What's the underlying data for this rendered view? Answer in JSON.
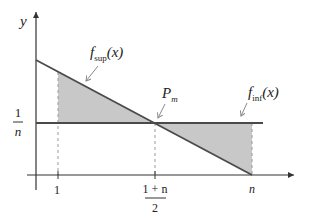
{
  "diagram": {
    "y_axis_label": "y",
    "y_tick_label": {
      "numerator": "1",
      "denominator": "n"
    },
    "x_tick_labels": [
      {
        "text": "1"
      },
      {
        "numerator": "1 + n",
        "denominator": "2"
      },
      {
        "text": "n"
      }
    ],
    "curves": {
      "sup": {
        "name": "f",
        "subscript": "sup",
        "arg": "(x)"
      },
      "inf": {
        "name": "f",
        "subscript": "inf",
        "arg": "(x)"
      }
    },
    "point": {
      "name": "P",
      "subscript": "m"
    },
    "colors": {
      "line": "#4a4a4a",
      "fill": "#c8c8c8",
      "dashed": "#9a9a9a",
      "axis": "#333333"
    }
  }
}
